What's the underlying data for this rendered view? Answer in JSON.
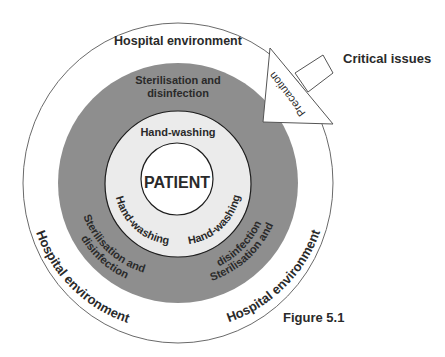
{
  "diagram": {
    "figure_label": "Figure 5.1",
    "center": "PATIENT",
    "rings": {
      "inner": {
        "label": "Hand-washing",
        "top_label": "Hand-washing",
        "left_label": "Hand-washing",
        "right_label": "Hand-washing",
        "color": "#ebebeb"
      },
      "middle": {
        "label": "Sterilisation and disinfection",
        "top_line1": "Sterilisation and",
        "top_line2": "disinfection",
        "left_line1": "Sterilisation and",
        "left_line2": "disinfection",
        "right_line1": "Sterilisation and",
        "right_line2": "disinfection",
        "color": "#8e8e8e"
      },
      "outer": {
        "label": "Hospital environment",
        "top_label": "Hospital environment",
        "left_label": "Hospital environment",
        "right_label": "Hospital environment",
        "color": "#ffffff"
      }
    },
    "arrow": {
      "label": "Precaution",
      "target_label": "Critical issues"
    }
  }
}
